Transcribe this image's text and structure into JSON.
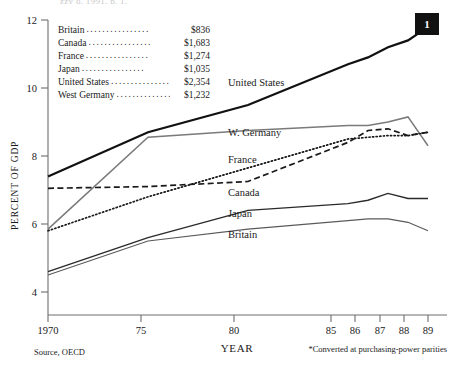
{
  "top_cut_text": "zzy o, 1991, p. 1,",
  "badge": {
    "label": "1"
  },
  "legend": {
    "rows": [
      {
        "country": "Britain",
        "dots": "................",
        "value": "$836"
      },
      {
        "country": "Canada",
        "dots": "................",
        "value": "$1,683"
      },
      {
        "country": "France",
        "dots": "................",
        "value": "$1,274"
      },
      {
        "country": "Japan",
        "dots": "................",
        "value": "$1,035"
      },
      {
        "country": "United States",
        "dots": "................",
        "value": "$2,354"
      },
      {
        "country": "West Germany",
        "dots": "................",
        "value": "$1,232"
      }
    ]
  },
  "axes": {
    "ylabel": "PERCENT OF GDP",
    "xlabel": "YEAR",
    "yticks": [
      "12",
      "10",
      "8",
      "6",
      "4"
    ],
    "xticks": [
      "1970",
      "75",
      "80",
      "85",
      "86",
      "87",
      "88",
      "89"
    ]
  },
  "footnotes": {
    "source": "Source, OECD",
    "note": "*Converted at purchasing-power parities"
  },
  "series_labels": {
    "united_states": "United States",
    "west_germany": "W. Germany",
    "france": "France",
    "canada": "Canada",
    "japan": "Japan",
    "britain": "Britain"
  },
  "chart_data": {
    "type": "line",
    "title": "",
    "xlabel": "YEAR",
    "ylabel": "PERCENT OF GDP",
    "xlim": [
      1970,
      1989
    ],
    "ylim": [
      3.6,
      12
    ],
    "grid": false,
    "legend": "inline-labels",
    "annotation": "*Converted at purchasing-power parities",
    "source": "Source, OECD",
    "per_capita_spending_usd": {
      "Britain": 836,
      "Canada": 1683,
      "France": 1274,
      "Japan": 1035,
      "United States": 2354,
      "West Germany": 1232
    },
    "x": [
      1970,
      1975,
      1980,
      1985,
      1986,
      1987,
      1988,
      1989
    ],
    "series": [
      {
        "name": "United States",
        "style": "solid-thick",
        "color": "#111111",
        "values": [
          7.4,
          8.7,
          9.5,
          10.7,
          10.9,
          11.2,
          11.4,
          11.8
        ]
      },
      {
        "name": "W. Germany",
        "style": "solid-gray",
        "color": "#6b6b6b",
        "values": [
          5.85,
          8.55,
          8.75,
          8.9,
          8.9,
          9.0,
          9.15,
          8.3
        ]
      },
      {
        "name": "France",
        "style": "dotted",
        "color": "#1a1a1a",
        "values": [
          5.8,
          6.8,
          7.65,
          8.5,
          8.55,
          8.6,
          8.6,
          8.7
        ]
      },
      {
        "name": "Canada",
        "style": "dashed",
        "color": "#1a1a1a",
        "values": [
          7.05,
          7.1,
          7.25,
          8.4,
          8.75,
          8.8,
          8.6,
          8.7
        ]
      },
      {
        "name": "Japan",
        "style": "solid",
        "color": "#2a2a2a",
        "values": [
          4.6,
          5.6,
          6.4,
          6.6,
          6.7,
          6.9,
          6.75,
          6.75
        ]
      },
      {
        "name": "Britain",
        "style": "solid-thin",
        "color": "#4a4a4a",
        "values": [
          4.5,
          5.5,
          5.85,
          6.1,
          6.15,
          6.15,
          6.05,
          5.8
        ]
      }
    ]
  }
}
